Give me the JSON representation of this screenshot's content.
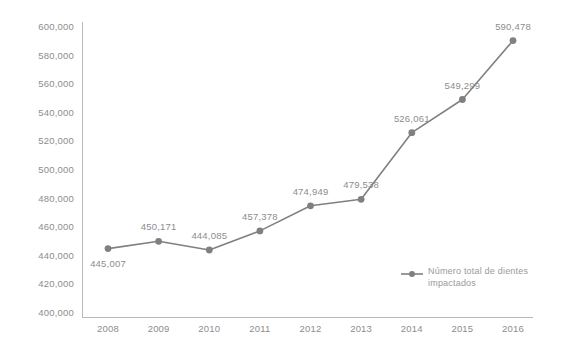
{
  "chart_data": {
    "type": "line",
    "title": "",
    "xlabel": "",
    "ylabel": "",
    "categories": [
      "2008",
      "2009",
      "2010",
      "2011",
      "2012",
      "2013",
      "2014",
      "2015",
      "2016"
    ],
    "values": [
      445007,
      450171,
      444085,
      457378,
      474949,
      479538,
      526061,
      549299,
      590478
    ],
    "value_labels": [
      "445,007",
      "450,171",
      "444,085",
      "457,378",
      "474,949",
      "479,538",
      "526,061",
      "549,299",
      "590,478"
    ],
    "label_positions": [
      "below",
      "above",
      "above",
      "above",
      "above",
      "above",
      "above",
      "above",
      "above"
    ],
    "series": [
      {
        "name": "Número total de dientes impactados",
        "values": [
          445007,
          450171,
          444085,
          457378,
          474949,
          479538,
          526061,
          549299,
          590478
        ]
      }
    ],
    "ylim": [
      400000,
      600000
    ],
    "ytick_step": 20000,
    "ytick_labels": [
      "600,000",
      "580,000",
      "560,000",
      "540,000",
      "520,000",
      "500,000",
      "480,000",
      "460,000",
      "440,000",
      "420,000",
      "400,000"
    ],
    "ytick_values": [
      600000,
      580000,
      560000,
      540000,
      520000,
      500000,
      480000,
      460000,
      440000,
      420000,
      400000
    ],
    "grid": false,
    "legend_position": "inside-bottom-right",
    "colors": {
      "line": "#808080",
      "marker": "#808080",
      "axis": "#b9b9b9",
      "tick_text": "#8d8d8d",
      "label_text": "#8d8d8d",
      "legend_text": "#9a9a9a",
      "background": "#ffffff"
    }
  },
  "legend": {
    "entries": [
      {
        "label": "Número total de dientes impactados",
        "marker": "line-circle-marker"
      }
    ]
  }
}
